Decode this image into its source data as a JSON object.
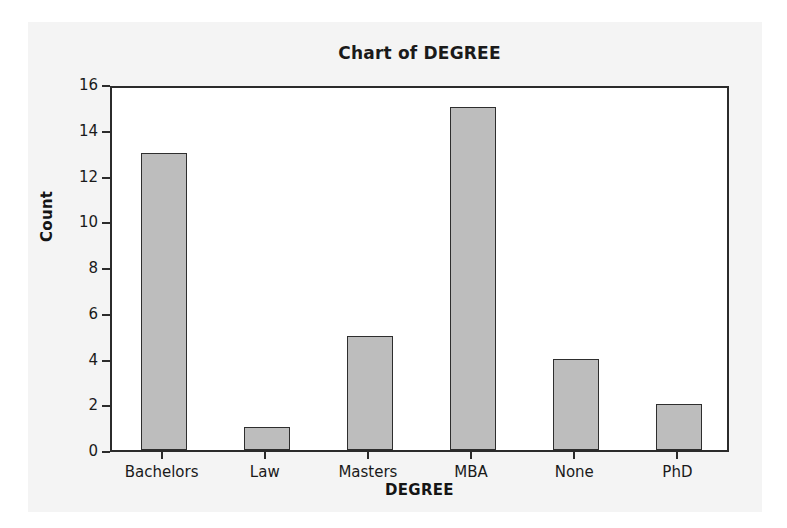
{
  "figure": {
    "background_color": "#f4f4f4",
    "plot_background_color": "#ffffff",
    "frame_color": "#2b2b2b"
  },
  "chart_data": {
    "type": "bar",
    "title": "Chart of DEGREE",
    "xlabel": "DEGREE",
    "ylabel": "Count",
    "categories": [
      "Bachelors",
      "Law",
      "Masters",
      "MBA",
      "None",
      "PhD"
    ],
    "values": [
      13,
      1,
      5,
      15,
      4,
      2
    ],
    "ylim": [
      0,
      16
    ],
    "yticks": [
      0,
      2,
      4,
      6,
      8,
      10,
      12,
      14,
      16
    ],
    "ytick_labels": [
      "0",
      "2",
      "4",
      "6",
      "8",
      "10",
      "12",
      "14",
      "16"
    ],
    "grid": false,
    "legend": null,
    "bar_fill_color": "#bdbdbd",
    "bar_edge_color": "#2e2e2e"
  }
}
